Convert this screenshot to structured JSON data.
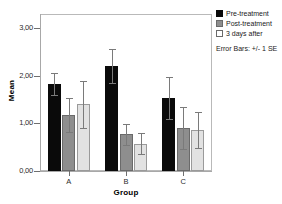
{
  "chart_data": {
    "type": "bar",
    "title": "",
    "xlabel": "Group",
    "ylabel": "Mean",
    "categories": [
      "A",
      "B",
      "C"
    ],
    "series": [
      {
        "name": "Pre-treatment",
        "color": "#0a0a0a",
        "values": [
          1.83,
          2.2,
          1.53
        ],
        "errors": [
          0.23,
          0.36,
          0.44
        ]
      },
      {
        "name": "Post-treatment",
        "color": "#8e8e8e",
        "values": [
          1.18,
          0.77,
          0.91
        ],
        "errors": [
          0.36,
          0.22,
          0.44
        ]
      },
      {
        "name": "3 days after",
        "color": "#e2e2e2",
        "values": [
          1.4,
          0.57,
          0.86
        ],
        "errors": [
          0.5,
          0.22,
          0.38
        ]
      }
    ],
    "ylim": [
      0,
      3.3
    ],
    "yticks": [
      0,
      1,
      2,
      3
    ],
    "ytick_labels": [
      "0,00",
      "1,00",
      "2,00",
      "3,00"
    ],
    "grid": false,
    "legend_position": "top-right",
    "annotations": [
      "Error Bars: +/- 1 SE"
    ]
  },
  "legend": {
    "items": [
      {
        "label": "Pre-treatment"
      },
      {
        "label": "Post-treatment"
      },
      {
        "label": "3 days after"
      }
    ],
    "note": "Error Bars: +/- 1 SE"
  },
  "axes": {
    "y_title": "Mean",
    "x_title": "Group"
  }
}
